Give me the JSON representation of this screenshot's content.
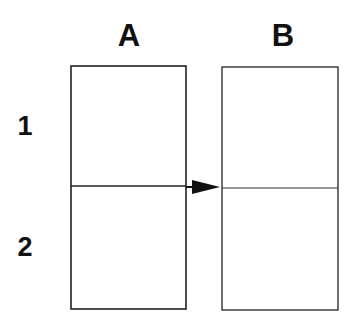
{
  "diagram": {
    "column_labels": [
      {
        "label": "A",
        "x": 129,
        "y": 46
      },
      {
        "label": "B",
        "x": 283,
        "y": 46
      }
    ],
    "row_labels": [
      {
        "label": "1",
        "x": 25,
        "y": 135
      },
      {
        "label": "2",
        "x": 25,
        "y": 256
      }
    ],
    "boxes": [
      {
        "name": "A",
        "x": 71,
        "y": 66,
        "width": 115,
        "height": 243,
        "divider_y": 186
      },
      {
        "name": "B",
        "x": 222,
        "y": 67,
        "width": 116,
        "height": 243,
        "divider_y": 188
      }
    ],
    "arrow": {
      "from": "A1/A2 boundary",
      "to": "B1/B2 boundary",
      "x1": 71,
      "y1": 186,
      "x2": 220,
      "y2": 188
    },
    "colors": {
      "stroke": "#222222",
      "text": "#111111",
      "background": "#ffffff"
    }
  }
}
